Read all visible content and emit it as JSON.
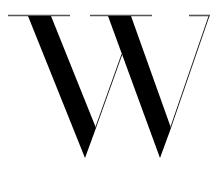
{
  "logo": {
    "letter": "W",
    "description": "Large serif capital W glyph with thin horizontal serifs",
    "colors": {
      "background": "#ffffff",
      "glyph": "#000000",
      "serif": "#555555",
      "thin_stroke": "#222222"
    }
  }
}
